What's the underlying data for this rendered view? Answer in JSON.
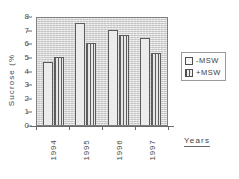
{
  "chart_data": {
    "type": "bar",
    "title": "",
    "categories": [
      "1994",
      "1995",
      "1996",
      "1997"
    ],
    "series": [
      {
        "name": "-MSW",
        "values": [
          4.6,
          7.5,
          7.0,
          6.35
        ]
      },
      {
        "name": "+MSW",
        "values": [
          5.0,
          6.05,
          6.6,
          5.25
        ]
      }
    ],
    "xlabel": "Years",
    "ylabel": "Sucrose (%",
    "ylim": [
      0,
      8
    ],
    "ytick_labels": [
      "0",
      "1",
      "2",
      "3",
      "4",
      "5",
      "6",
      "7",
      "8"
    ],
    "ytick_values": [
      0,
      1,
      2,
      3,
      4,
      5,
      6,
      7,
      8
    ],
    "grid": false,
    "legend_position": "right",
    "legend": [
      {
        "label": "-MSW",
        "swatch": "open-square"
      },
      {
        "label": "+MSW",
        "swatch": "hatched-square"
      }
    ],
    "colors": {
      "plot_background": "#d6d6d6",
      "bar_minus_msw": "#ececec",
      "bar_plus_msw": "#e2e2e2",
      "bar_outline": "#5c5c5c",
      "axis": "#6a6a6a",
      "text": "#4a4a4a"
    }
  }
}
